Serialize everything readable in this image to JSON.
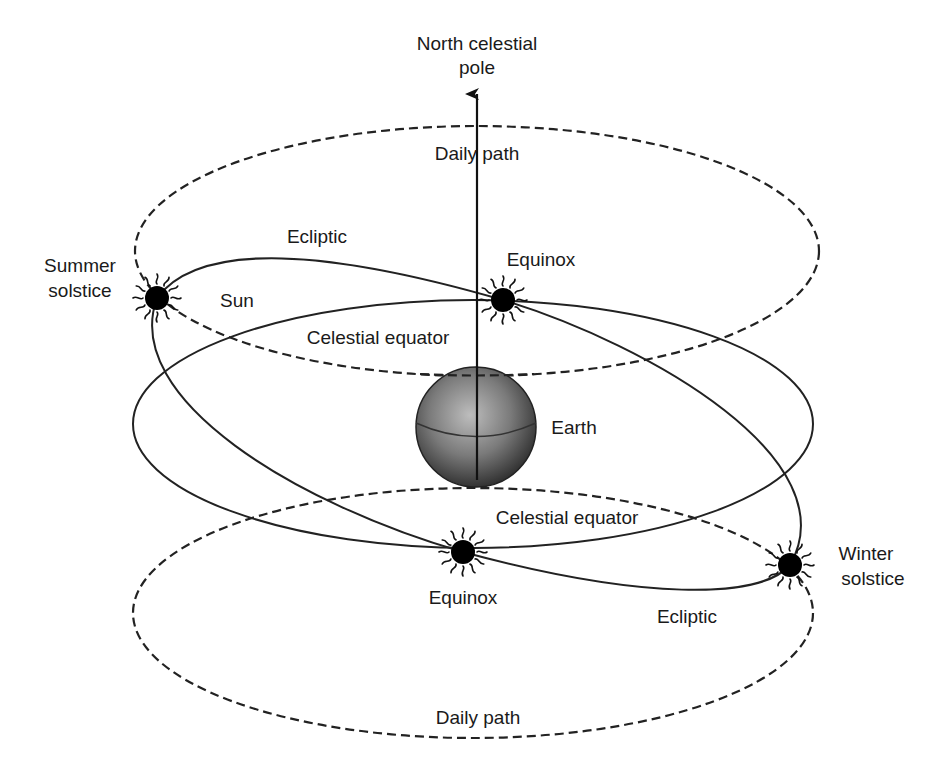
{
  "diagram": {
    "labels": {
      "north_pole_line1": "North celestial",
      "north_pole_line2": "pole",
      "daily_path_top": "Daily path",
      "daily_path_bottom": "Daily path",
      "ecliptic_top": "Ecliptic",
      "ecliptic_bottom": "Ecliptic",
      "equinox_top": "Equinox",
      "equinox_bottom": "Equinox",
      "summer_solstice_line1": "Summer",
      "summer_solstice_line2": "solstice",
      "winter_solstice_line1": "Winter",
      "winter_solstice_line2": "solstice",
      "sun": "Sun",
      "celestial_equator_top": "Celestial equator",
      "celestial_equator_bottom": "Celestial equator",
      "earth": "Earth"
    },
    "colors": {
      "line": "#222222",
      "sun_fill": "#000000",
      "earth_light": "#b8b8b8",
      "earth_dark": "#2e2e2e",
      "background": "#ffffff"
    },
    "geometry": {
      "daily_path_top": {
        "cx": 477,
        "cy": 251,
        "rx": 342,
        "ry": 125
      },
      "daily_path_bottom": {
        "cx": 473,
        "cy": 613,
        "rx": 340,
        "ry": 125
      },
      "celestial_equator": {
        "cx": 473,
        "cy": 424,
        "rx": 340,
        "ry": 124
      },
      "earth": {
        "cx": 476,
        "cy": 427,
        "r": 60
      },
      "pole_axis": {
        "x": 477,
        "y_bottom": 480,
        "y_top": 92
      },
      "suns": [
        {
          "name": "summer-solstice",
          "x": 157,
          "y": 298
        },
        {
          "name": "equinox-top",
          "x": 503,
          "y": 300
        },
        {
          "name": "equinox-bottom",
          "x": 463,
          "y": 552
        },
        {
          "name": "winter-solstice",
          "x": 790,
          "y": 565
        }
      ]
    }
  }
}
